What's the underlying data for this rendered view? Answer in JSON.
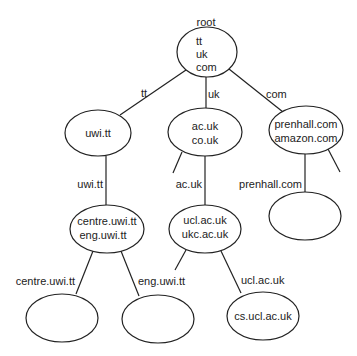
{
  "diagram": {
    "title_label": "root",
    "nodes": {
      "root": {
        "lines": [
          "tt",
          "uk",
          "com"
        ]
      },
      "uwi": {
        "lines": [
          "uwi.tt"
        ]
      },
      "acuk": {
        "lines": [
          "ac.uk",
          "co.uk"
        ]
      },
      "com": {
        "lines": [
          "prenhall.com",
          "amazon.com"
        ]
      },
      "centre": {
        "lines": [
          "centre.uwi.tt",
          "eng.uwi.tt"
        ]
      },
      "ucl": {
        "lines": [
          "ucl.ac.uk",
          "ukc.ac.uk"
        ]
      },
      "centre_child": {
        "lines": []
      },
      "eng_child": {
        "lines": []
      },
      "cs": {
        "lines": [
          "cs.ucl.ac.uk"
        ]
      },
      "prenhall_child": {
        "lines": []
      }
    },
    "edge_labels": {
      "root_tt": "tt",
      "root_uk": "uk",
      "root_com": "com",
      "uwi_centre": "uwi.tt",
      "acuk_ucl": "ac.uk",
      "com_prenhall": "prenhall.com",
      "centre_left": "centre.uwi.tt",
      "centre_right": "eng.uwi.tt",
      "ucl_cs": "ucl.ac.uk"
    }
  }
}
